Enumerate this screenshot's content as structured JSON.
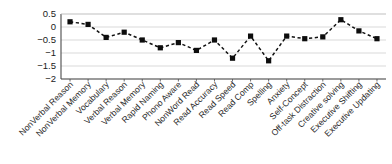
{
  "chart_data": {
    "type": "line",
    "title": "",
    "subtitle": "",
    "xlabel": "",
    "ylabel": "",
    "ylim": [
      -2,
      0.5
    ],
    "yticks": [
      0.5,
      0,
      -0.5,
      -1,
      -1.5,
      -2
    ],
    "ytick_labels": [
      "0.5",
      "0",
      "−0.5",
      "−1",
      "−1.5",
      "−2"
    ],
    "grid": true,
    "legend": "none",
    "marker": "square",
    "linestyle": "dashed",
    "color": "#0d0d0d",
    "categories": [
      "NonVerbal Reason",
      "NonVerbal Memory",
      "Vocabulary",
      "Verbal Reason",
      "Verbal Memory",
      "Rapid Naming",
      "Phono Aware",
      "NonWord Read",
      "Read Accuracy",
      "Read Speed",
      "Read Comp",
      "Spelling",
      "Anxiety",
      "Self-Concept",
      "Off-task Distraction",
      "Creative solving",
      "Executive Shifting",
      "Executive Updating"
    ],
    "values": [
      0.2,
      0.1,
      -0.4,
      -0.2,
      -0.5,
      -0.8,
      -0.6,
      -0.9,
      -0.5,
      -1.2,
      -0.35,
      -1.3,
      -0.35,
      -0.45,
      -0.38,
      0.28,
      -0.15,
      -0.45
    ]
  }
}
